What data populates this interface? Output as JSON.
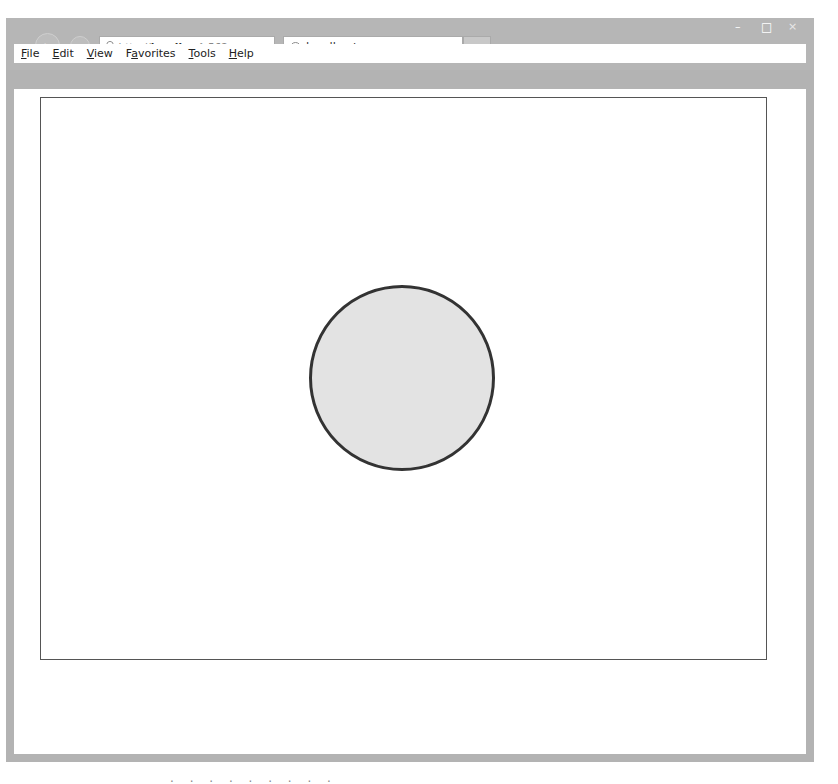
{
  "browser": {
    "address_bar": {
      "protocol": "http://",
      "host": "localhost",
      "port_fragment": ":562"
    },
    "tab": {
      "title": "localhost",
      "close_glyph": "×"
    },
    "window_controls": {
      "minimize": "–",
      "maximize": "□",
      "close": "×"
    },
    "nav": {
      "back_glyph": "←",
      "forward_glyph": "→",
      "search_glyph": "⌕",
      "dropdown_glyph": "▾",
      "compat_glyph": "▤",
      "refresh_glyph": "↻"
    },
    "right_icons": {
      "home": "⌂",
      "favorites": "★",
      "settings": "⚙"
    },
    "menu": [
      {
        "label": "File",
        "accel": "F"
      },
      {
        "label": "Edit",
        "accel": "E"
      },
      {
        "label": "View",
        "accel": "V"
      },
      {
        "label": "Favorites",
        "accel": "a"
      },
      {
        "label": "Tools",
        "accel": "T"
      },
      {
        "label": "Help",
        "accel": "H"
      }
    ]
  },
  "page": {
    "canvas": {
      "border_color": "#555555",
      "circle": {
        "cx": 402,
        "cy": 378,
        "r": 93,
        "fill": "#e3e3e3",
        "stroke": "#333333",
        "stroke_width": 3
      }
    }
  },
  "caption": {
    "text": "·  ·  ·  ·  ·  ·  ·  ·  ·"
  }
}
